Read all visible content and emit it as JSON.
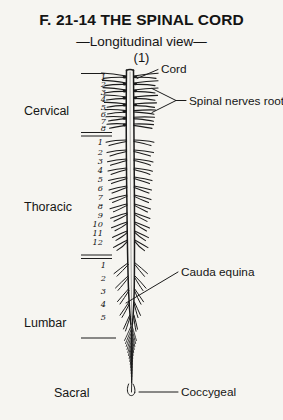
{
  "figure": {
    "title": "F. 21-14  THE SPINAL CORD",
    "subtitle": "—Longitudinal view—",
    "plate_number": "(1)",
    "background_color": "#f6f5f1",
    "ink_color": "#1b1b1b"
  },
  "regions": [
    {
      "name": "Cervical",
      "label": "Cervical",
      "segments": [
        "1",
        "2",
        "3",
        "4",
        "5",
        "6",
        "7",
        "8"
      ]
    },
    {
      "name": "Thoracic",
      "label": "Thoracic",
      "segments": [
        "1",
        "2",
        "3",
        "4",
        "5",
        "6",
        "7",
        "8",
        "9",
        "10",
        "11",
        "12"
      ]
    },
    {
      "name": "Lumbar",
      "label": "Lumbar",
      "segments": [
        "1",
        "2",
        "3",
        "4",
        "5"
      ]
    },
    {
      "name": "Sacral",
      "label": "Sacral",
      "segments": []
    }
  ],
  "callouts": [
    {
      "name": "cord",
      "text": "Cord"
    },
    {
      "name": "spinal-nerves-roots",
      "text": "Spinal nerves roots"
    },
    {
      "name": "cauda-equina",
      "text": "Cauda equina"
    },
    {
      "name": "coccygeal",
      "text": "Coccygeal"
    }
  ],
  "segment_numbers": {
    "cervical": [
      "1",
      "2",
      "3",
      "4",
      "5",
      "6",
      "7",
      "8"
    ],
    "thoracic": [
      "1",
      "2",
      "3",
      "4",
      "5",
      "6",
      "7",
      "8",
      "9",
      "10",
      "11",
      "12"
    ],
    "lumbar": [
      "1",
      "2",
      "3",
      "4",
      "5"
    ]
  }
}
